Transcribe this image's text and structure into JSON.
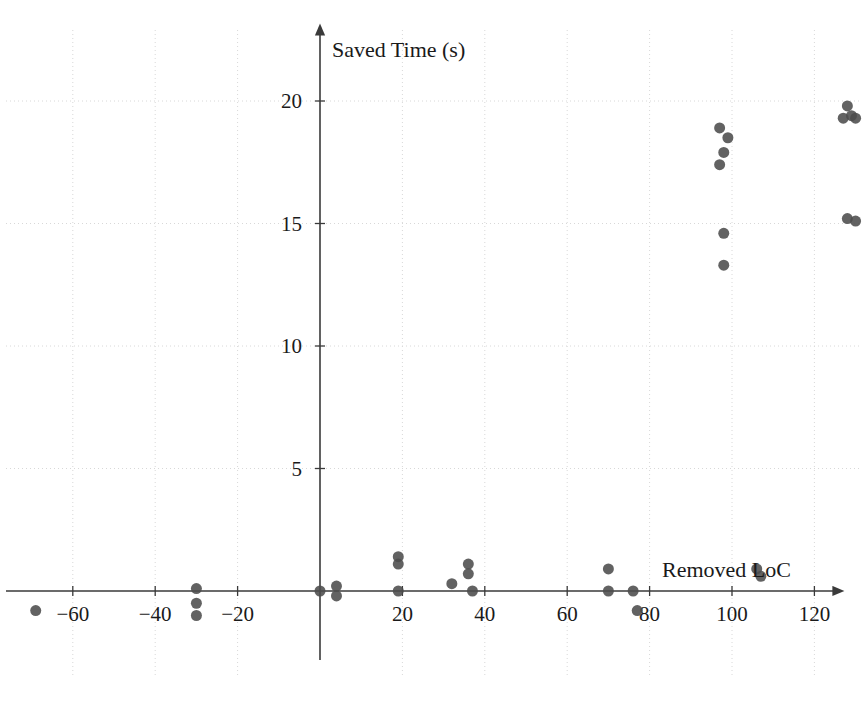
{
  "chart_data": {
    "type": "scatter",
    "title": "",
    "xlabel": "Removed LoC",
    "ylabel": "Saved Time (s)",
    "xlim": [
      -75,
      135
    ],
    "ylim": [
      -2,
      21.5
    ],
    "xticks": [
      -60,
      -40,
      -20,
      20,
      40,
      60,
      80,
      100,
      120
    ],
    "xtick_labels": [
      "−60",
      "−40",
      "−20",
      "20",
      "40",
      "60",
      "80",
      "100",
      "120"
    ],
    "yticks": [
      5,
      10,
      15,
      20
    ],
    "ytick_labels": [
      "5",
      "10",
      "15",
      "20"
    ],
    "grid": true,
    "grid_style": "dotted",
    "legend": "none",
    "marker": {
      "shape": "circle",
      "color": "#4c4c4c",
      "size_px": 11,
      "opacity": 0.88
    },
    "points": [
      {
        "x": -69,
        "y": -0.8
      },
      {
        "x": -30,
        "y": 0.1
      },
      {
        "x": -30,
        "y": -0.5
      },
      {
        "x": -30,
        "y": -1.0
      },
      {
        "x": 0,
        "y": 0.0
      },
      {
        "x": 4,
        "y": 0.2
      },
      {
        "x": 4,
        "y": -0.2
      },
      {
        "x": 19,
        "y": 1.4
      },
      {
        "x": 19,
        "y": 1.1
      },
      {
        "x": 19,
        "y": 0.0
      },
      {
        "x": 32,
        "y": 0.3
      },
      {
        "x": 36,
        "y": 1.1
      },
      {
        "x": 36,
        "y": 0.7
      },
      {
        "x": 37,
        "y": 0.0
      },
      {
        "x": 70,
        "y": 0.9
      },
      {
        "x": 70,
        "y": 0.0
      },
      {
        "x": 76,
        "y": 0.0
      },
      {
        "x": 77,
        "y": -0.8
      },
      {
        "x": 97,
        "y": 18.9
      },
      {
        "x": 99,
        "y": 18.5
      },
      {
        "x": 98,
        "y": 17.9
      },
      {
        "x": 97,
        "y": 17.4
      },
      {
        "x": 98,
        "y": 14.6
      },
      {
        "x": 98,
        "y": 13.3
      },
      {
        "x": 106,
        "y": 0.9
      },
      {
        "x": 107,
        "y": 0.6
      },
      {
        "x": 128,
        "y": 19.8
      },
      {
        "x": 129,
        "y": 19.4
      },
      {
        "x": 127,
        "y": 19.3
      },
      {
        "x": 130,
        "y": 19.3
      },
      {
        "x": 128,
        "y": 15.2
      },
      {
        "x": 130,
        "y": 15.1
      }
    ],
    "axes_style": {
      "origin_px": {
        "x": 320,
        "y": 591
      },
      "x_unit_px": 4.12,
      "y_unit_px": 24.5,
      "arrow_heads": true,
      "spine_color": "#3a3a3a"
    }
  }
}
